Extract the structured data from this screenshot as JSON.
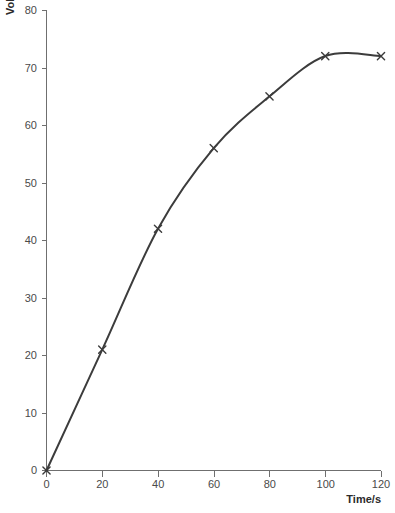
{
  "chart_data": {
    "type": "line",
    "title": "",
    "subtitle": "",
    "xlabel": "Time/s",
    "ylabel": "Volume of gas/cm³",
    "xlim": [
      0,
      120
    ],
    "ylim": [
      0,
      80
    ],
    "xticks": [
      0,
      20,
      40,
      60,
      80,
      100,
      120
    ],
    "yticks": [
      0,
      10,
      20,
      30,
      40,
      50,
      60,
      70,
      80
    ],
    "xtick_labels": [
      "0",
      "20",
      "40",
      "60",
      "80",
      "100",
      "120"
    ],
    "ytick_labels": [
      "0",
      "10",
      "20",
      "30",
      "40",
      "50",
      "60",
      "70",
      "80"
    ],
    "grid": false,
    "legend": null,
    "marker": "x",
    "line_color": "#3c3c3c",
    "axis_color": "#6f6f6f",
    "x": [
      0,
      20,
      40,
      60,
      80,
      100,
      120
    ],
    "values": [
      0,
      21,
      42,
      56,
      65,
      72,
      72
    ],
    "series": [
      {
        "name": "Volume of gas collected",
        "x": [
          0,
          20,
          40,
          60,
          80,
          100,
          120
        ],
        "values": [
          0,
          21,
          42,
          56,
          65,
          72,
          72
        ]
      }
    ],
    "annotations": []
  },
  "axes": {
    "y_title": "Volume of gas/cm³",
    "x_title": "Time/s"
  }
}
